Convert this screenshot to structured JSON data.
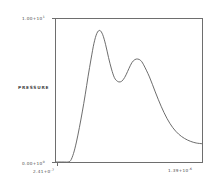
{
  "chart_data": {
    "type": "line",
    "title": "",
    "xlabel": "",
    "ylabel": "PRESSURE",
    "grid": false,
    "legend": null,
    "axis_labels": {
      "y_top_mantissa": "1.00+10",
      "y_top_exponent": "1",
      "y_bottom_mantissa": "0.00+10",
      "y_bottom_exponent": "0",
      "x_left_mantissa": "2.41+0",
      "x_left_exponent": "-7",
      "x_right_mantissa": "1.39+10",
      "x_right_exponent": "-6"
    },
    "xlim": [
      2.41e-07,
      1.39e-06
    ],
    "ylim": [
      0.0,
      1.0
    ],
    "ytick_values": [
      0.0,
      1.0
    ],
    "xtick_values": [
      2.41e-07,
      1.39e-06
    ],
    "series": [
      {
        "name": "pressure",
        "description": "bimodal pressure pulse with sharp rise, tall first peak, shallow valley, lower second peak, and long decaying tail to an elevated plateau",
        "x": [
          0.0,
          0.02,
          0.04,
          0.06,
          0.08,
          0.1,
          0.12,
          0.14,
          0.16,
          0.18,
          0.2,
          0.22,
          0.24,
          0.26,
          0.28,
          0.3,
          0.32,
          0.34,
          0.36,
          0.38,
          0.4,
          0.42,
          0.44,
          0.46,
          0.48,
          0.5,
          0.52,
          0.54,
          0.56,
          0.58,
          0.6,
          0.64,
          0.68,
          0.72,
          0.76,
          0.8,
          0.84,
          0.88,
          0.92,
          0.96,
          1.0
        ],
        "y": [
          0.0,
          0.0,
          0.0,
          0.0,
          0.0,
          0.01,
          0.06,
          0.14,
          0.24,
          0.35,
          0.47,
          0.6,
          0.72,
          0.83,
          0.9,
          0.92,
          0.89,
          0.82,
          0.73,
          0.65,
          0.59,
          0.565,
          0.56,
          0.575,
          0.61,
          0.655,
          0.695,
          0.716,
          0.72,
          0.71,
          0.68,
          0.595,
          0.49,
          0.39,
          0.305,
          0.24,
          0.195,
          0.165,
          0.145,
          0.133,
          0.128
        ]
      }
    ],
    "colors": {
      "curve": "#5a5a5a",
      "frame": "#6e6e6e",
      "background": "#ffffff",
      "text": "#4a4a4a"
    }
  }
}
